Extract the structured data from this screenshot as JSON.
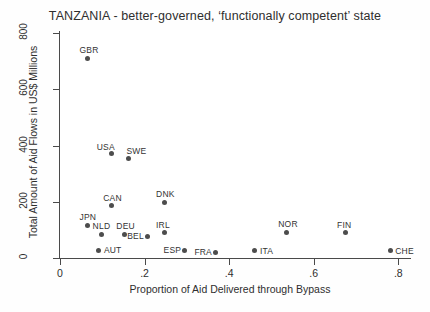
{
  "chart_data": {
    "type": "scatter",
    "title": "TANZANIA - better-governed, ‘functionally competent’ state",
    "xlabel": "Proportion of Aid Delivered through Bypass",
    "ylabel": "Total Amount of Aid Flows in US$ Millions",
    "xlim": [
      0,
      0.83
    ],
    "ylim": [
      0,
      800
    ],
    "xticks": [
      "0",
      ".2",
      ".4",
      ".6",
      ".8"
    ],
    "xtick_values": [
      0,
      0.2,
      0.4,
      0.6,
      0.8
    ],
    "yticks": [
      "0",
      "200",
      "400",
      "600",
      "800"
    ],
    "ytick_values": [
      0,
      200,
      400,
      600,
      800
    ],
    "grid": false,
    "legend": "none",
    "marker_color": "#4d4d4d",
    "axis_color": "#4a4a4a",
    "points": [
      {
        "label": "GBR",
        "x": 0.066,
        "y": 711,
        "label_pos": "above"
      },
      {
        "label": "USA",
        "x": 0.122,
        "y": 370,
        "label_pos": "above-left"
      },
      {
        "label": "SWE",
        "x": 0.162,
        "y": 355,
        "label_pos": "above-right"
      },
      {
        "label": "CAN",
        "x": 0.122,
        "y": 185,
        "label_pos": "above"
      },
      {
        "label": "DNK",
        "x": 0.247,
        "y": 199,
        "label_pos": "above"
      },
      {
        "label": "JPN",
        "x": 0.066,
        "y": 117,
        "label_pos": "above"
      },
      {
        "label": "NLD",
        "x": 0.097,
        "y": 85,
        "label_pos": "above"
      },
      {
        "label": "DEU",
        "x": 0.153,
        "y": 85,
        "label_pos": "above"
      },
      {
        "label": "BEL",
        "x": 0.208,
        "y": 78,
        "label_pos": "left"
      },
      {
        "label": "IRL",
        "x": 0.247,
        "y": 89,
        "label_pos": "above"
      },
      {
        "label": "AUT",
        "x": 0.092,
        "y": 28,
        "label_pos": "right"
      },
      {
        "label": "ESP",
        "x": 0.294,
        "y": 28,
        "label_pos": "left"
      },
      {
        "label": "FRA",
        "x": 0.367,
        "y": 21,
        "label_pos": "left"
      },
      {
        "label": "ITA",
        "x": 0.461,
        "y": 25,
        "label_pos": "right"
      },
      {
        "label": "NOR",
        "x": 0.536,
        "y": 92,
        "label_pos": "above"
      },
      {
        "label": "FIN",
        "x": 0.675,
        "y": 89,
        "label_pos": "above"
      },
      {
        "label": "CHE",
        "x": 0.781,
        "y": 25,
        "label_pos": "right"
      }
    ]
  }
}
